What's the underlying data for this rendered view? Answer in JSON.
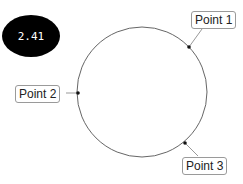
{
  "badge": {
    "value": "2.41"
  },
  "circle": {
    "cx": 142,
    "cy": 92,
    "r": 65,
    "stroke": "#666666"
  },
  "points": [
    {
      "label": "Point 1",
      "x": 189,
      "y": 47
    },
    {
      "label": "Point 2",
      "x": 78,
      "y": 93
    },
    {
      "label": "Point 3",
      "x": 185,
      "y": 143
    }
  ]
}
